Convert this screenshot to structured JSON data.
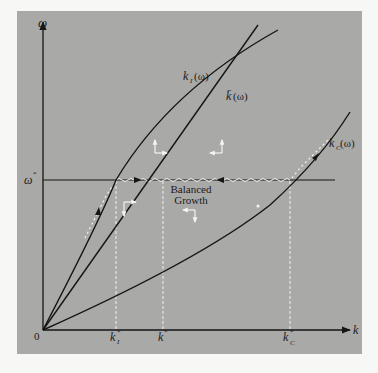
{
  "figure": {
    "type": "phase-diagram",
    "axes": {
      "y_label": "ω",
      "x_label": "k",
      "origin_label": "0"
    },
    "reference_lines": {
      "omega_star_label": "ω*",
      "omega_star_sup": "*"
    },
    "x_ticks": [
      {
        "id": "kI_star",
        "base": "k",
        "sub": "I",
        "sup": "*"
      },
      {
        "id": "k_star",
        "base": "k",
        "sub": "",
        "sup": "*"
      },
      {
        "id": "kC_star",
        "base": "k",
        "sub": "C",
        "sup": "*"
      }
    ],
    "curves": [
      {
        "id": "kI",
        "base": "k",
        "sub": "I",
        "arg": "(ω)"
      },
      {
        "id": "k",
        "base": "k̄",
        "sub": "",
        "arg": "(ω)"
      },
      {
        "id": "kC",
        "base": "k",
        "sub": "C",
        "arg": "(ω)"
      }
    ],
    "annotation": {
      "line1": "Balanced",
      "line2": "Growth"
    },
    "colors": {
      "panel_bg": "#a9a9a7",
      "page_bg": "#f7f7f6",
      "curve": "#151515",
      "dashed": "#f2f2f2"
    }
  }
}
